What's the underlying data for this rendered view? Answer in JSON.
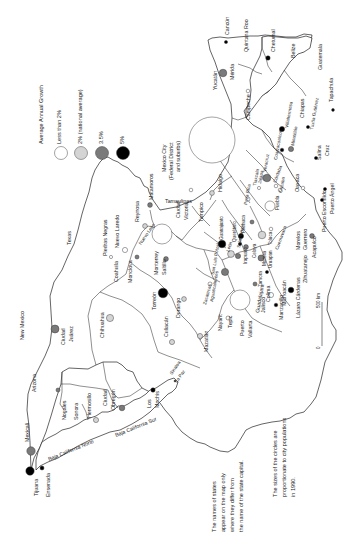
{
  "legend": {
    "title": "Average Annual Growth",
    "items": [
      {
        "label": "Less than 2%",
        "fill": "#ffffff"
      },
      {
        "label": "2% (national average)",
        "fill": "#d4d4d4"
      },
      {
        "label": "3.5%",
        "fill": "#7a7a7a"
      },
      {
        "label": "5%",
        "fill": "#000000"
      }
    ]
  },
  "notes": {
    "states_line1": "The names of states",
    "states_line2": "appear on the map only",
    "states_line3": "where they differ from",
    "states_line4": "the name of the state capital.",
    "sizes_line1": "The sizes of the circles are",
    "sizes_line2": "proportionate to city populations",
    "sizes_line3": "in 1990."
  },
  "scale": {
    "zero": "0",
    "max": "500 km"
  },
  "mexico_city": {
    "line1": "Mexico City",
    "line2": "(Federal District",
    "line3": "and suburbs)"
  },
  "countries_regions": {
    "new_mexico": "New Mexico",
    "arizona": "Arizona",
    "texas": "Texas",
    "belize": "Belize",
    "guatemala": "Guatemala"
  },
  "states": {
    "baja_norte": "Baja California Norte",
    "baja_sur": "Baja California Sur",
    "sonora": "Sonora",
    "sinaloa": "Sinaloa",
    "coahuila": "Coahuila",
    "nuevo_leon": "Nuevo León",
    "tamaulipas": "Tamaulipas",
    "nayarit": "Nayarit",
    "jalisco": "Jalisco",
    "michoacan": "Michoacán",
    "guerrero": "Guerrero",
    "morelos": "Morelos",
    "hidalgo": "Hidalgo",
    "chiapas": "Chiapas",
    "quintana_roo": "Quintana Roo",
    "yucatan": "Yucatán"
  },
  "cities": {
    "tijuana": "Tijuana",
    "ensenada": "Ensenada",
    "mexicali": "Mexicali",
    "nogales": "Nogales",
    "hermosillo": "Hermosillo",
    "ciudad_obregon_1": "Ciudad",
    "ciudad_obregon_2": "Obregón",
    "los_mochis_1": "Los",
    "los_mochis_2": "Mochis",
    "la_paz": "La Paz",
    "ciudad_juarez_1": "Ciudad",
    "ciudad_juarez_2": "Juárez",
    "chihuahua": "Chihuahua",
    "culiacan": "Culiacán",
    "mazatlan": "Mazatlán",
    "durango": "Durango",
    "torreon": "Torreón",
    "monclova": "Monclova",
    "piedras_negras": "Piedras Negras",
    "nuevo_laredo": "Nuevo Laredo",
    "reynosa": "Reynosa",
    "matamoros": "Matamoros",
    "monterrey": "Monterrey",
    "saltillo": "Saltillo",
    "ciudad_victoria_1": "Ciudad",
    "ciudad_victoria_2": "Victoria",
    "tampico": "Tampico",
    "zacatecas": "Zacatecas",
    "aguascalientes": "Aguascalientes",
    "san_luis_potosi": "San Luis Potosí",
    "guanajuato": "Guanajuato",
    "leon": "León",
    "irapuato": "Irapuato",
    "celaya": "Celaya",
    "queretaro": "Querétaro",
    "salamanca": "Salamanca",
    "pachuca": "Pachuca",
    "tepic": "Tepic",
    "puerto_vallarta_1": "Puerto",
    "puerto_vallarta_2": "Vallarta",
    "guadalajara": "Guadalajara",
    "colima": "Colima",
    "manzanillo": "Manzanillo",
    "zamora": "Zamora",
    "morelia": "Morelia",
    "uruapan": "Uruapan",
    "toluca": "Toluca",
    "cuernavaca": "Cuernavaca",
    "lazaro_cardenas": "Lázaro Cárdenas",
    "zihuatanejo": "Zihuatanejo",
    "acapulco": "Acapulco",
    "puerto_escondido": "Puerto Escondido",
    "puerto_angel": "Puerto Ángel",
    "poza_rica": "Poza Rica",
    "tlaxcala": "Tlaxcala",
    "jalapa": "Jalapa",
    "veracruz": "Veracruz",
    "cordoba": "Córdoba",
    "orizaba": "Orizaba",
    "puebla": "Puebla",
    "oaxaca": "Oaxaca",
    "coatzacoalcos": "Coatzacoalcos",
    "minatitlan": "Minatitlán",
    "villahermosa": "Villahermosa",
    "tuxtla": "Tuxtla Gutiérrez",
    "salina_cruz_1": "Salina",
    "salina_cruz_2": "Cruz",
    "tapachula": "Tapachula",
    "campeche": "Campeche",
    "merida": "Mérida",
    "cancun": "Cancún",
    "chetumal": "Chetumal"
  }
}
